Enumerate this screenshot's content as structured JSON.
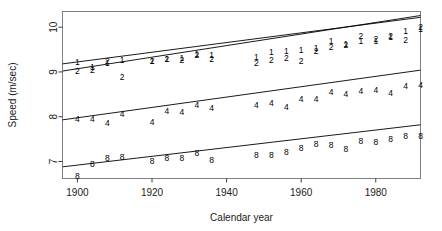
{
  "figure": {
    "background": "#ffffff",
    "frame_color": "#808080",
    "axis_color": "#3c3c3c",
    "line_color": "#000000",
    "glyph_color": "#000000"
  },
  "chart_data": {
    "type": "scatter",
    "title": "",
    "xlabel": "Calendar year",
    "ylabel": "Speed (m/sec)",
    "xlim": [
      1896,
      1992
    ],
    "ylim": [
      6.62,
      10.35
    ],
    "xticks": [
      1900,
      1920,
      1940,
      1960,
      1980
    ],
    "xtick_labels": [
      "1900",
      "1920",
      "1940",
      "1960",
      "1980"
    ],
    "yticks": [
      7,
      8,
      9,
      10
    ],
    "ytick_labels": [
      "7",
      "8",
      "9",
      "10"
    ],
    "grid": false,
    "legend": "none",
    "point_marker": "series digit glyph",
    "series": [
      {
        "name": "1",
        "glyph": "1",
        "color": "#000000",
        "fit_line": {
          "x0": 1896,
          "y0": 9.18,
          "x1": 1992,
          "y1": 10.22
        },
        "points": [
          {
            "x": 1900,
            "y": 9.22
          },
          {
            "x": 1904,
            "y": 9.1
          },
          {
            "x": 1908,
            "y": 9.21
          },
          {
            "x": 1912,
            "y": 9.26
          },
          {
            "x": 1920,
            "y": 9.24
          },
          {
            "x": 1924,
            "y": 9.3
          },
          {
            "x": 1928,
            "y": 9.32
          },
          {
            "x": 1932,
            "y": 9.39
          },
          {
            "x": 1936,
            "y": 9.37
          },
          {
            "x": 1948,
            "y": 9.33
          },
          {
            "x": 1952,
            "y": 9.45
          },
          {
            "x": 1956,
            "y": 9.46
          },
          {
            "x": 1960,
            "y": 9.5
          },
          {
            "x": 1964,
            "y": 9.53
          },
          {
            "x": 1968,
            "y": 9.7
          },
          {
            "x": 1972,
            "y": 9.63
          },
          {
            "x": 1976,
            "y": 9.7
          },
          {
            "x": 1980,
            "y": 9.68
          },
          {
            "x": 1984,
            "y": 9.78
          },
          {
            "x": 1988,
            "y": 9.92
          },
          {
            "x": 1992,
            "y": 9.96
          }
        ]
      },
      {
        "name": "2",
        "glyph": "2",
        "color": "#000000",
        "fit_line": {
          "x0": 1896,
          "y0": 9.02,
          "x1": 1992,
          "y1": 10.26
        },
        "points": [
          {
            "x": 1900,
            "y": 9.02
          },
          {
            "x": 1904,
            "y": 9.05
          },
          {
            "x": 1908,
            "y": 9.24
          },
          {
            "x": 1912,
            "y": 8.88
          },
          {
            "x": 1920,
            "y": 9.24
          },
          {
            "x": 1924,
            "y": 9.3
          },
          {
            "x": 1928,
            "y": 9.26
          },
          {
            "x": 1932,
            "y": 9.37
          },
          {
            "x": 1936,
            "y": 9.29
          },
          {
            "x": 1948,
            "y": 9.19
          },
          {
            "x": 1952,
            "y": 9.27
          },
          {
            "x": 1956,
            "y": 9.32
          },
          {
            "x": 1960,
            "y": 9.24
          },
          {
            "x": 1964,
            "y": 9.47
          },
          {
            "x": 1968,
            "y": 9.56
          },
          {
            "x": 1972,
            "y": 9.6
          },
          {
            "x": 1976,
            "y": 9.8
          },
          {
            "x": 1980,
            "y": 9.74
          },
          {
            "x": 1984,
            "y": 9.81
          },
          {
            "x": 1988,
            "y": 9.71
          },
          {
            "x": 1992,
            "y": 10.0
          }
        ]
      },
      {
        "name": "4",
        "glyph": "4",
        "color": "#000000",
        "fit_line": {
          "x0": 1896,
          "y0": 7.93,
          "x1": 1992,
          "y1": 9.04
        },
        "points": [
          {
            "x": 1900,
            "y": 7.94
          },
          {
            "x": 1904,
            "y": 7.96
          },
          {
            "x": 1908,
            "y": 7.86
          },
          {
            "x": 1912,
            "y": 8.05
          },
          {
            "x": 1920,
            "y": 7.89
          },
          {
            "x": 1924,
            "y": 8.13
          },
          {
            "x": 1928,
            "y": 8.11
          },
          {
            "x": 1932,
            "y": 8.27
          },
          {
            "x": 1936,
            "y": 8.2
          },
          {
            "x": 1948,
            "y": 8.27
          },
          {
            "x": 1952,
            "y": 8.3
          },
          {
            "x": 1956,
            "y": 8.21
          },
          {
            "x": 1960,
            "y": 8.4
          },
          {
            "x": 1964,
            "y": 8.39
          },
          {
            "x": 1968,
            "y": 8.56
          },
          {
            "x": 1972,
            "y": 8.5
          },
          {
            "x": 1976,
            "y": 8.57
          },
          {
            "x": 1980,
            "y": 8.59
          },
          {
            "x": 1984,
            "y": 8.52
          },
          {
            "x": 1988,
            "y": 8.68
          },
          {
            "x": 1992,
            "y": 8.71
          }
        ]
      },
      {
        "name": "8",
        "glyph": "8",
        "color": "#000000",
        "fit_line": {
          "x0": 1896,
          "y0": 6.88,
          "x1": 1992,
          "y1": 7.82
        },
        "points": [
          {
            "x": 1900,
            "y": 6.67
          },
          {
            "x": 1904,
            "y": 6.94
          },
          {
            "x": 1908,
            "y": 7.08
          },
          {
            "x": 1912,
            "y": 7.11
          },
          {
            "x": 1920,
            "y": 7.01
          },
          {
            "x": 1924,
            "y": 7.08
          },
          {
            "x": 1928,
            "y": 7.07
          },
          {
            "x": 1932,
            "y": 7.18
          },
          {
            "x": 1936,
            "y": 7.04
          },
          {
            "x": 1948,
            "y": 7.14
          },
          {
            "x": 1952,
            "y": 7.14
          },
          {
            "x": 1956,
            "y": 7.22
          },
          {
            "x": 1960,
            "y": 7.3
          },
          {
            "x": 1964,
            "y": 7.39
          },
          {
            "x": 1968,
            "y": 7.37
          },
          {
            "x": 1972,
            "y": 7.29
          },
          {
            "x": 1976,
            "y": 7.45
          },
          {
            "x": 1980,
            "y": 7.43
          },
          {
            "x": 1984,
            "y": 7.5
          },
          {
            "x": 1988,
            "y": 7.56
          },
          {
            "x": 1992,
            "y": 7.56
          }
        ]
      }
    ]
  }
}
